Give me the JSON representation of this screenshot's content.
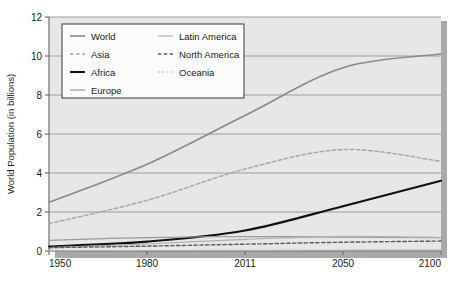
{
  "chart_data": {
    "type": "line",
    "title": "",
    "xlabel": "",
    "ylabel": "World Population (in billions)",
    "categories": [
      "1950",
      "1980",
      "2011",
      "2050",
      "2100"
    ],
    "x_tick_labels": [
      "1950",
      "1980",
      "2011",
      "2050",
      "2100"
    ],
    "y_tick_labels": [
      "0",
      "2",
      "4",
      "6",
      "8",
      "10",
      "12"
    ],
    "y_ticks": [
      0,
      2,
      4,
      6,
      8,
      10,
      12
    ],
    "ylim": [
      0,
      12
    ],
    "grid": "horizontal",
    "legend_position": "top-left-inside",
    "series": [
      {
        "name": "World",
        "values": [
          2.5,
          4.45,
          6.95,
          9.4,
          10.1
        ],
        "color": "#8a8a8a",
        "style": "solid",
        "width": 1.6
      },
      {
        "name": "Asia",
        "values": [
          1.4,
          2.6,
          4.2,
          5.2,
          4.6
        ],
        "color": "#a8a8a8",
        "style": "dashed",
        "width": 1.5
      },
      {
        "name": "Africa",
        "values": [
          0.23,
          0.48,
          1.05,
          2.3,
          3.6
        ],
        "color": "#111111",
        "style": "solid",
        "width": 2.1
      },
      {
        "name": "Europe",
        "values": [
          0.55,
          0.69,
          0.74,
          0.71,
          0.68
        ],
        "color": "#9a9a9a",
        "style": "solid",
        "width": 1.2
      },
      {
        "name": "Latin America",
        "values": [
          0.17,
          0.36,
          0.6,
          0.75,
          0.69
        ],
        "color": "#b0b0b0",
        "style": "solid",
        "width": 1.2
      },
      {
        "name": "North America",
        "values": [
          0.17,
          0.25,
          0.35,
          0.45,
          0.51
        ],
        "color": "#5a5a5a",
        "style": "dashed",
        "width": 1.4
      },
      {
        "name": "Oceania",
        "values": [
          0.013,
          0.023,
          0.037,
          0.055,
          0.066
        ],
        "color": "#b8b8b8",
        "style": "dotted",
        "width": 1.1
      }
    ],
    "legend_entries": [
      {
        "label": "World",
        "column": 0
      },
      {
        "label": "Asia",
        "column": 0
      },
      {
        "label": "Africa",
        "column": 0
      },
      {
        "label": "Europe",
        "column": 0
      },
      {
        "label": "Latin America",
        "column": 1
      },
      {
        "label": "North America",
        "column": 1
      },
      {
        "label": "Oceania",
        "column": 1
      }
    ],
    "colors": {
      "plot_background": "#e7e7e7",
      "gridline": "#9d9d9d",
      "axis": "#6f6f6f",
      "shadow": "#a9a9a9",
      "legend_background": "#fbfbfb",
      "legend_border": "#4a4a4a",
      "text": "#1a1a1a"
    }
  }
}
